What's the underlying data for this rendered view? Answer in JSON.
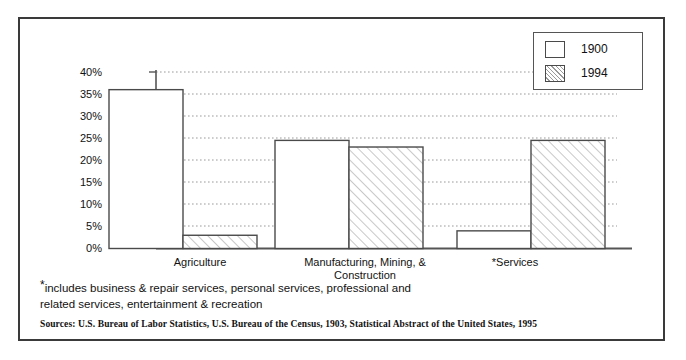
{
  "chart_data": {
    "type": "bar",
    "title": "",
    "subtitle": "",
    "xlabel": "",
    "ylabel": "",
    "categories": [
      "Agriculture",
      "Manufacturing, Mining, & Construction",
      "*Services"
    ],
    "category_lines": [
      [
        "Agriculture"
      ],
      [
        "Manufacturing, Mining, &",
        "Construction"
      ],
      [
        "*Services"
      ]
    ],
    "series": [
      {
        "name": "1900",
        "values": [
          36,
          24.5,
          4
        ],
        "fill": "solid-white"
      },
      {
        "name": "1994",
        "values": [
          3,
          23,
          24.5
        ],
        "fill": "diagonal-hatch"
      }
    ],
    "ylim": [
      0,
      40
    ],
    "ytick_values": [
      0,
      5,
      10,
      15,
      20,
      25,
      30,
      35,
      40
    ],
    "ytick_labels": [
      "0%",
      "5%",
      "10%",
      "15%",
      "20%",
      "25%",
      "30%",
      "35%",
      "40%"
    ],
    "grid": true,
    "grid_style": "dotted-horizontal",
    "legend_position": "top-right"
  },
  "legend": {
    "entries": [
      {
        "label": "1900",
        "swatch": "white-square-icon"
      },
      {
        "label": "1994",
        "swatch": "hatched-square-icon"
      }
    ]
  },
  "footnote": {
    "star": "*",
    "line1": "includes business & repair services, personal services, professional and",
    "line2": "related services, entertainment & recreation"
  },
  "sources": {
    "text": "Sources: U.S. Bureau of Labor Statistics, U.S. Bureau of the Census, 1903, Statistical Abstract of the United States, 1995"
  },
  "colors": {
    "frame": "#3a3a3a",
    "bar_outline": "#4a4a4a",
    "hatch": "#9a9a9a",
    "axis": "#555555",
    "gridline": "#9a9a9a",
    "text": "#111111",
    "background": "#ffffff"
  }
}
